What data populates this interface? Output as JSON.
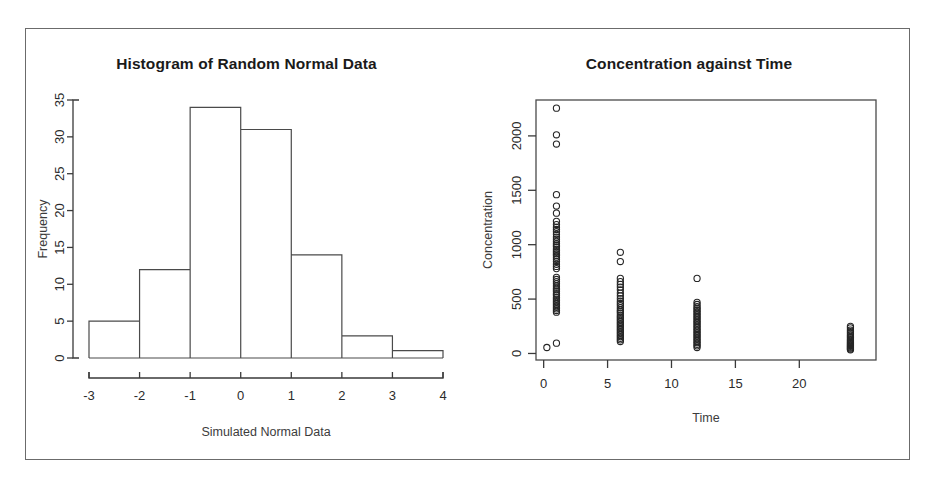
{
  "figure": {
    "background": "#ffffff",
    "border_color": "#6b6b6b",
    "panels": 2
  },
  "chart_data": [
    {
      "type": "bar",
      "title": "Histogram of Random Normal Data",
      "xlabel": "Simulated Normal Data",
      "ylabel": "Frequency",
      "categories": [
        "-3 to -2",
        "-2 to -1",
        "-1 to 0",
        "0 to 1",
        "1 to 2",
        "2 to 3",
        "3 to 4"
      ],
      "bin_edges": [
        -3,
        -2,
        -1,
        0,
        1,
        2,
        3,
        4
      ],
      "values": [
        5,
        12,
        34,
        31,
        14,
        3,
        1
      ],
      "xlim": [
        -3,
        4
      ],
      "ylim": [
        0,
        35
      ],
      "xticks": [
        "-3",
        "-2",
        "-1",
        "0",
        "1",
        "2",
        "3",
        "4"
      ],
      "xtick_values": [
        -3,
        -2,
        -1,
        0,
        1,
        2,
        3,
        4
      ],
      "yticks": [
        "0",
        "5",
        "10",
        "15",
        "20",
        "25",
        "30",
        "35"
      ],
      "ytick_values": [
        0,
        5,
        10,
        15,
        20,
        25,
        30,
        35
      ],
      "grid": false,
      "legend": "none",
      "bar_fill": "none",
      "bar_stroke": "#4a4a4a"
    },
    {
      "type": "scatter",
      "title": "Concentration against Time",
      "xlabel": "Time",
      "ylabel": "Concentration",
      "xlim": [
        -0.6,
        26
      ],
      "ylim": [
        -60,
        2330
      ],
      "xticks": [
        "0",
        "5",
        "10",
        "15",
        "20"
      ],
      "xtick_values": [
        0,
        5,
        10,
        15,
        20
      ],
      "yticks": [
        "0",
        "500",
        "1000",
        "1500",
        "2000"
      ],
      "ytick_values": [
        0,
        500,
        1000,
        1500,
        2000
      ],
      "grid": false,
      "legend": "none",
      "box": true,
      "marker": "open-circle",
      "marker_stroke": "#262626",
      "time_groups": [
        0.25,
        1,
        6,
        12,
        24
      ],
      "points": [
        [
          0.25,
          55
        ],
        [
          1,
          2255
        ],
        [
          1,
          2010
        ],
        [
          1,
          1925
        ],
        [
          1,
          1460
        ],
        [
          1,
          1355
        ],
        [
          1,
          1290
        ],
        [
          1,
          1215
        ],
        [
          1,
          1185
        ],
        [
          1,
          1160
        ],
        [
          1,
          1140
        ],
        [
          1,
          1120
        ],
        [
          1,
          1095
        ],
        [
          1,
          1070
        ],
        [
          1,
          1050
        ],
        [
          1,
          1030
        ],
        [
          1,
          1010
        ],
        [
          1,
          995
        ],
        [
          1,
          980
        ],
        [
          1,
          960
        ],
        [
          1,
          945
        ],
        [
          1,
          930
        ],
        [
          1,
          915
        ],
        [
          1,
          900
        ],
        [
          1,
          885
        ],
        [
          1,
          865
        ],
        [
          1,
          845
        ],
        [
          1,
          820
        ],
        [
          1,
          800
        ],
        [
          1,
          780
        ],
        [
          1,
          700
        ],
        [
          1,
          680
        ],
        [
          1,
          660
        ],
        [
          1,
          640
        ],
        [
          1,
          620
        ],
        [
          1,
          600
        ],
        [
          1,
          585
        ],
        [
          1,
          570
        ],
        [
          1,
          550
        ],
        [
          1,
          535
        ],
        [
          1,
          515
        ],
        [
          1,
          500
        ],
        [
          1,
          485
        ],
        [
          1,
          470
        ],
        [
          1,
          455
        ],
        [
          1,
          440
        ],
        [
          1,
          425
        ],
        [
          1,
          410
        ],
        [
          1,
          395
        ],
        [
          1,
          380
        ],
        [
          1,
          95
        ],
        [
          6,
          930
        ],
        [
          6,
          845
        ],
        [
          6,
          690
        ],
        [
          6,
          660
        ],
        [
          6,
          635
        ],
        [
          6,
          610
        ],
        [
          6,
          585
        ],
        [
          6,
          555
        ],
        [
          6,
          530
        ],
        [
          6,
          505
        ],
        [
          6,
          480
        ],
        [
          6,
          460
        ],
        [
          6,
          440
        ],
        [
          6,
          420
        ],
        [
          6,
          400
        ],
        [
          6,
          385
        ],
        [
          6,
          370
        ],
        [
          6,
          350
        ],
        [
          6,
          335
        ],
        [
          6,
          320
        ],
        [
          6,
          305
        ],
        [
          6,
          290
        ],
        [
          6,
          275
        ],
        [
          6,
          260
        ],
        [
          6,
          245
        ],
        [
          6,
          230
        ],
        [
          6,
          215
        ],
        [
          6,
          200
        ],
        [
          6,
          185
        ],
        [
          6,
          170
        ],
        [
          6,
          155
        ],
        [
          6,
          140
        ],
        [
          6,
          125
        ],
        [
          6,
          110
        ],
        [
          12,
          690
        ],
        [
          12,
          470
        ],
        [
          12,
          450
        ],
        [
          12,
          430
        ],
        [
          12,
          415
        ],
        [
          12,
          400
        ],
        [
          12,
          385
        ],
        [
          12,
          370
        ],
        [
          12,
          355
        ],
        [
          12,
          340
        ],
        [
          12,
          325
        ],
        [
          12,
          310
        ],
        [
          12,
          295
        ],
        [
          12,
          280
        ],
        [
          12,
          265
        ],
        [
          12,
          250
        ],
        [
          12,
          235
        ],
        [
          12,
          220
        ],
        [
          12,
          205
        ],
        [
          12,
          190
        ],
        [
          12,
          175
        ],
        [
          12,
          160
        ],
        [
          12,
          145
        ],
        [
          12,
          130
        ],
        [
          12,
          115
        ],
        [
          12,
          100
        ],
        [
          12,
          85
        ],
        [
          12,
          70
        ],
        [
          12,
          55
        ],
        [
          24,
          250
        ],
        [
          24,
          235
        ],
        [
          24,
          215
        ],
        [
          24,
          200
        ],
        [
          24,
          185
        ],
        [
          24,
          170
        ],
        [
          24,
          158
        ],
        [
          24,
          146
        ],
        [
          24,
          134
        ],
        [
          24,
          122
        ],
        [
          24,
          112
        ],
        [
          24,
          102
        ],
        [
          24,
          92
        ],
        [
          24,
          82
        ],
        [
          24,
          74
        ],
        [
          24,
          66
        ],
        [
          24,
          58
        ],
        [
          24,
          50
        ],
        [
          24,
          42
        ],
        [
          24,
          34
        ]
      ]
    }
  ]
}
